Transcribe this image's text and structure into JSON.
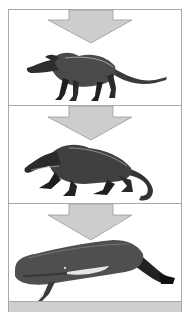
{
  "diagram": {
    "type": "evolution-sequence",
    "direction": "top-to-bottom",
    "colors": {
      "arrow_fill": "#cdcdcd",
      "arrow_stroke": "#9a9a9a",
      "panel_border": "#a9a9a9",
      "ink": "#1c1c1c",
      "bottom_bar": "#cfcfcf"
    },
    "panels": [
      {
        "index": 1,
        "arrow": "down-arrow-icon",
        "illustration": "pakicetus-like land mammal, four slender legs, long thin tail"
      },
      {
        "index": 2,
        "arrow": "down-arrow-icon",
        "illustration": "ambulocetus-like semi-aquatic crouching mammal, long snout, heavy tail"
      },
      {
        "index": 3,
        "arrow": "down-arrow-icon",
        "illustration": "sperm whale, blunt head, flipper, tail fluke"
      }
    ]
  }
}
